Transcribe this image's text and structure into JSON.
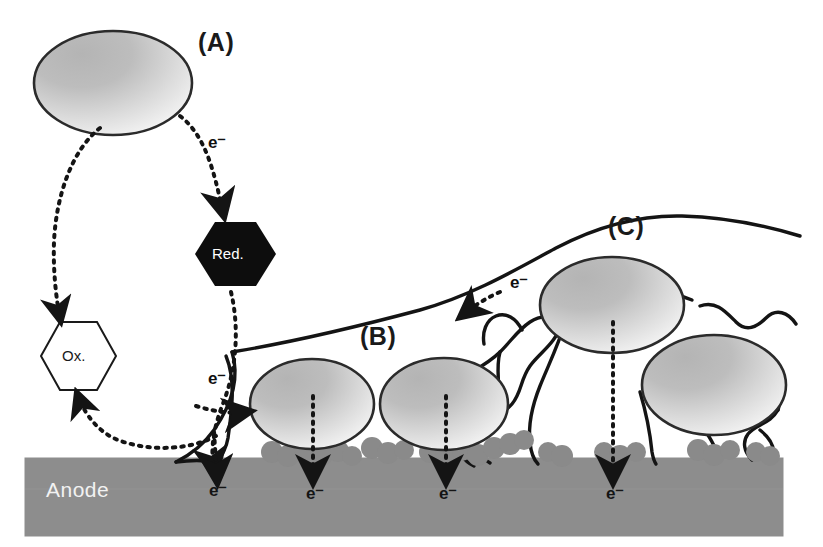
{
  "figure": {
    "type": "diagram",
    "background_color": "#ffffff"
  },
  "panels": [
    {
      "id": "A",
      "label": "(A)",
      "mechanism": "mediated electron transfer via soluble redox shuttle"
    },
    {
      "id": "B",
      "label": "(B)",
      "mechanism": "direct electron transfer via outer-membrane cytochromes"
    },
    {
      "id": "C",
      "label": "(C)",
      "mechanism": "electron transfer via conductive pili / nanowires"
    }
  ],
  "nodes": {
    "red": {
      "label": "Red.",
      "shape": "hexagon",
      "fill": "#0d0d0d",
      "text_color": "#ffffff"
    },
    "ox": {
      "label": "Ox.",
      "shape": "hexagon",
      "fill": "#ffffff",
      "text_color": "#1a1a1a",
      "stroke": "#1a1a1a"
    }
  },
  "electrode": {
    "label": "Anode",
    "fill": "#8d8d8d",
    "text_color": "#f2f2f2"
  },
  "electron_labels": [
    {
      "id": "e-a-shuttle",
      "text": "e⁻"
    },
    {
      "id": "e-b-approach",
      "text": "e⁻"
    },
    {
      "id": "e-c-nanowire",
      "text": "e⁻"
    },
    {
      "id": "e-anode-1",
      "text": "e⁻"
    },
    {
      "id": "e-anode-2",
      "text": "e⁻"
    },
    {
      "id": "e-anode-3",
      "text": "e⁻"
    },
    {
      "id": "e-anode-4",
      "text": "e⁻"
    }
  ],
  "colors": {
    "cell_fill_dark": "#a9a9a9",
    "cell_fill_light": "#f2f2f2",
    "cell_stroke": "#2b2b2b",
    "cytochrome_blob": "#8a8a8a",
    "nanowire": "#141414",
    "dotted_arrow": "#141414"
  }
}
